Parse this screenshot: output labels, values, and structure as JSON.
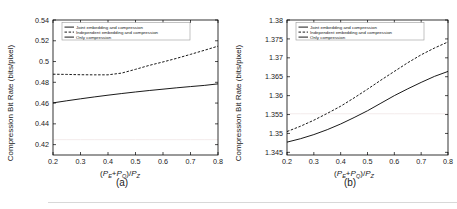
{
  "figure": {
    "panels": [
      {
        "caption": "(a)",
        "ylabel": "Compression Bit Rate (bits/pixel)",
        "xlabel_parts": {
          "open": "(",
          "p1": "P",
          "p1sub": "E",
          "plus": "+",
          "p2": "P",
          "p2sub": "Q",
          "close": ")/",
          "p3": "P",
          "p3sub": "Z"
        },
        "legend": [
          {
            "label": "Joint embedding and compression",
            "style": "solid"
          },
          {
            "label": "Independent embedding and compression",
            "style": "dashed"
          },
          {
            "label": "Only compression",
            "style": "flat"
          }
        ]
      },
      {
        "caption": "(b)",
        "ylabel": "Compression Bit Rate (bits/pixel)",
        "xlabel_parts": {
          "open": "(",
          "p1": "P",
          "p1sub": "E",
          "plus": "+",
          "p2": "P",
          "p2sub": "Q",
          "close": ")/",
          "p3": "P",
          "p3sub": "Z"
        },
        "legend": [
          {
            "label": "Joint embedding and compression",
            "style": "solid"
          },
          {
            "label": "Independent embedding and compression",
            "style": "dashed"
          },
          {
            "label": "Only compression",
            "style": "flat"
          }
        ]
      }
    ]
  },
  "chart_data": [
    {
      "type": "line",
      "title": "",
      "panel": "(a)",
      "xlabel": "(P_E+P_Q)/P_Z",
      "ylabel": "Compression Bit Rate (bits/pixel)",
      "xlim": [
        0.2,
        0.8
      ],
      "ylim": [
        0.41,
        0.54
      ],
      "xticks": [
        0.2,
        0.3,
        0.4,
        0.5,
        0.6,
        0.7,
        0.8
      ],
      "xtick_labels": [
        "0.2",
        "0.3",
        "0.4",
        "0.5",
        "0.6",
        "0.7",
        "0.8"
      ],
      "yticks": [
        0.42,
        0.44,
        0.46,
        0.48,
        0.5,
        0.52,
        0.54
      ],
      "ytick_labels": [
        "0.42",
        "0.44",
        "0.46",
        "0.48",
        "0.5",
        "0.52",
        "0.54"
      ],
      "grid": false,
      "legend_position": "top-left",
      "x": [
        0.2,
        0.25,
        0.3,
        0.35,
        0.4,
        0.45,
        0.5,
        0.55,
        0.6,
        0.65,
        0.7,
        0.75,
        0.8
      ],
      "series": [
        {
          "name": "Joint embedding and compression",
          "style": "solid",
          "values": [
            0.4602,
            0.4622,
            0.4641,
            0.4659,
            0.4676,
            0.4692,
            0.4707,
            0.4721,
            0.4734,
            0.4747,
            0.4759,
            0.477,
            0.4785
          ]
        },
        {
          "name": "Independent embedding and compression",
          "style": "dashed",
          "values": [
            0.4878,
            0.4876,
            0.4873,
            0.4872,
            0.4872,
            0.4889,
            0.4925,
            0.4963,
            0.4996,
            0.5031,
            0.5069,
            0.5108,
            0.5148
          ]
        },
        {
          "name": "Only compression",
          "style": "flat",
          "values": [
            0.4248,
            0.4248,
            0.4248,
            0.4248,
            0.4248,
            0.4248,
            0.4248,
            0.4248,
            0.4248,
            0.4248,
            0.4248,
            0.4248,
            0.4248
          ]
        }
      ]
    },
    {
      "type": "line",
      "title": "",
      "panel": "(b)",
      "xlabel": "(P_E+P_Q)/P_Z",
      "ylabel": "Compression Bit Rate (bits/pixel)",
      "xlim": [
        0.2,
        0.8
      ],
      "ylim": [
        1.3443,
        1.38
      ],
      "xticks": [
        0.2,
        0.3,
        0.4,
        0.5,
        0.6,
        0.7,
        0.8
      ],
      "xtick_labels": [
        "0.2",
        "0.3",
        "0.4",
        "0.5",
        "0.6",
        "0.7",
        "0.8"
      ],
      "yticks": [
        1.345,
        1.35,
        1.355,
        1.36,
        1.365,
        1.37,
        1.375,
        1.38
      ],
      "ytick_labels": [
        "1.345",
        "1.35",
        "1.355",
        "1.36",
        "1.365",
        "1.37",
        "1.375",
        "1.38"
      ],
      "grid": false,
      "legend_position": "top-left",
      "x": [
        0.2,
        0.25,
        0.3,
        0.35,
        0.4,
        0.45,
        0.5,
        0.55,
        0.6,
        0.65,
        0.7,
        0.75,
        0.8
      ],
      "series": [
        {
          "name": "Joint embedding and compression",
          "style": "solid",
          "values": [
            1.3477,
            1.3486,
            1.3497,
            1.351,
            1.3525,
            1.3542,
            1.356,
            1.358,
            1.36,
            1.3618,
            1.3635,
            1.3651,
            1.3664
          ]
        },
        {
          "name": "Independent embedding and compression",
          "style": "dashed",
          "values": [
            1.3505,
            1.3519,
            1.3535,
            1.3553,
            1.3572,
            1.3594,
            1.3617,
            1.3641,
            1.3664,
            1.3687,
            1.3708,
            1.3726,
            1.3742
          ]
        },
        {
          "name": "Only compression",
          "style": "flat",
          "values": [
            1.3552,
            1.3552,
            1.3552,
            1.3552,
            1.3552,
            1.3552,
            1.3552,
            1.3552,
            1.3552,
            1.3552,
            1.3552,
            1.3552,
            1.3552
          ]
        }
      ]
    }
  ]
}
